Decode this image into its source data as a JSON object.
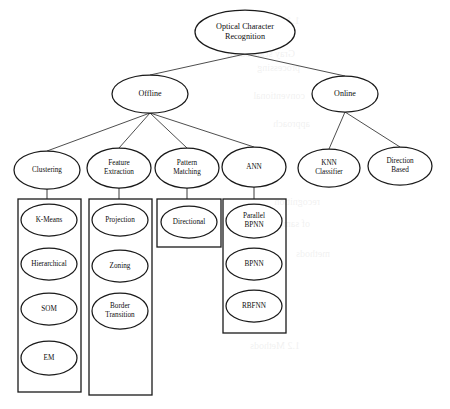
{
  "document": {
    "type": "scanned-figure",
    "title": "Optical Character Recognition taxonomy tree",
    "background_color": "#ffffff",
    "ink_color": "#1a1a1a"
  },
  "tree": {
    "root": {
      "label": "Optical Character\nRecognition",
      "cx": 245,
      "cy": 32,
      "rx": 50,
      "ry": 22
    },
    "level2": [
      {
        "id": "offline",
        "label": "Offline",
        "cx": 150,
        "cy": 94,
        "rx": 38,
        "ry": 19
      },
      {
        "id": "online",
        "label": "Online",
        "cx": 345,
        "cy": 94,
        "rx": 33,
        "ry": 18
      }
    ],
    "level3": [
      {
        "id": "clustering",
        "label": "Clustering",
        "parent": "offline",
        "cx": 47,
        "cy": 170,
        "rx": 33,
        "ry": 19
      },
      {
        "id": "feature-extraction",
        "label": "Feature\nExtraction",
        "parent": "offline",
        "cx": 119,
        "cy": 168,
        "rx": 32,
        "ry": 20
      },
      {
        "id": "pattern-matching",
        "label": "Pattern\nMatching",
        "parent": "offline",
        "cx": 187,
        "cy": 168,
        "rx": 32,
        "ry": 20
      },
      {
        "id": "ann",
        "label": "ANN",
        "parent": "offline",
        "cx": 254,
        "cy": 167,
        "rx": 32,
        "ry": 20
      },
      {
        "id": "knn-classifier",
        "label": "KNN\nClassifier",
        "parent": "online",
        "cx": 329,
        "cy": 168,
        "rx": 31,
        "ry": 19
      },
      {
        "id": "direction-based",
        "label": "Direction\nBased",
        "parent": "online",
        "cx": 400,
        "cy": 166,
        "rx": 32,
        "ry": 19
      }
    ],
    "groups": [
      {
        "id": "clustering-group",
        "parent": "clustering",
        "box": {
          "x": 18,
          "y": 199,
          "width": 63,
          "height": 193
        },
        "items": [
          {
            "label": "K-Means",
            "cx": 49,
            "cy": 220,
            "rx": 28,
            "ry": 16
          },
          {
            "label": "Hierarchical",
            "cx": 49,
            "cy": 264,
            "rx": 28,
            "ry": 16
          },
          {
            "label": "SOM",
            "cx": 49,
            "cy": 309,
            "rx": 28,
            "ry": 16
          },
          {
            "label": "EM",
            "cx": 49,
            "cy": 358,
            "rx": 28,
            "ry": 17
          }
        ]
      },
      {
        "id": "feature-extraction-group",
        "parent": "feature-extraction",
        "box": {
          "x": 89,
          "y": 199,
          "width": 63,
          "height": 196
        },
        "items": [
          {
            "label": "Projection",
            "cx": 120,
            "cy": 220,
            "rx": 28,
            "ry": 16
          },
          {
            "label": "Zoning",
            "cx": 120,
            "cy": 266,
            "rx": 28,
            "ry": 16
          },
          {
            "label": "Border\nTransition",
            "cx": 120,
            "cy": 311,
            "rx": 28,
            "ry": 18
          }
        ]
      },
      {
        "id": "pattern-matching-group",
        "parent": "pattern-matching",
        "box": {
          "x": 157,
          "y": 199,
          "width": 64,
          "height": 48
        },
        "items": [
          {
            "label": "Directional",
            "cx": 189,
            "cy": 222,
            "rx": 28,
            "ry": 16
          }
        ]
      },
      {
        "id": "ann-group",
        "parent": "ann",
        "box": {
          "x": 223,
          "y": 199,
          "width": 63,
          "height": 134
        },
        "items": [
          {
            "label": "Parallel\nBPNN",
            "cx": 254,
            "cy": 221,
            "rx": 28,
            "ry": 17
          },
          {
            "label": "BPNN",
            "cx": 254,
            "cy": 264,
            "rx": 28,
            "ry": 16
          },
          {
            "label": "RBFNN",
            "cx": 254,
            "cy": 306,
            "rx": 28,
            "ry": 16
          }
        ]
      }
    ]
  },
  "bleed_through_text": [
    {
      "text": "1.1  Algorithms of the",
      "x": 300,
      "y": 14,
      "size": 11
    },
    {
      "text": "Gray scale based",
      "x": 295,
      "y": 48,
      "size": 10
    },
    {
      "text": "processing",
      "x": 300,
      "y": 62,
      "size": 10
    },
    {
      "text": "conventional",
      "x": 305,
      "y": 90,
      "size": 10
    },
    {
      "text": "approach",
      "x": 310,
      "y": 118,
      "size": 10
    },
    {
      "text": "recognition",
      "x": 320,
      "y": 196,
      "size": 10
    },
    {
      "text": "of sampling",
      "x": 310,
      "y": 218,
      "size": 10
    },
    {
      "text": "methods",
      "x": 330,
      "y": 248,
      "size": 10
    },
    {
      "text": "1.2  Methods",
      "x": 300,
      "y": 340,
      "size": 10
    }
  ]
}
